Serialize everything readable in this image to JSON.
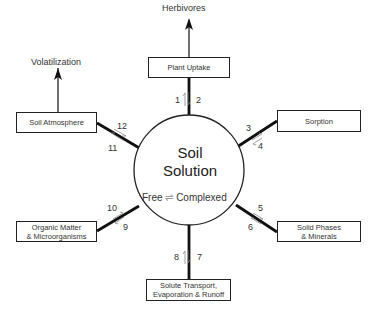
{
  "diagram": {
    "center": {
      "title_line1": "Soil",
      "title_line2": "Solution",
      "equilibrium_left": "Free",
      "equilibrium_arrow": "⇌",
      "equilibrium_right": "Complexed"
    },
    "nodes": [
      {
        "id": "plant_uptake",
        "label": "Plant Uptake",
        "numbers": [
          "1",
          "2"
        ]
      },
      {
        "id": "sorption",
        "label": "Sorption",
        "numbers": [
          "3",
          "4"
        ]
      },
      {
        "id": "solid_phases",
        "label_line1": "Solid Phases",
        "label_line2": "& Minerals",
        "numbers": [
          "5",
          "6"
        ]
      },
      {
        "id": "solute_transport",
        "label_line1": "Solute Transport,",
        "label_line2": "Evaporation & Runoff",
        "numbers": [
          "7",
          "8"
        ]
      },
      {
        "id": "organic_matter",
        "label_line1": "Organic Matter",
        "label_line2": "& Microorganisms",
        "numbers": [
          "9",
          "10"
        ]
      },
      {
        "id": "soil_atmosphere",
        "label": "Soil Atmosphere",
        "numbers": [
          "11",
          "12"
        ]
      }
    ],
    "outputs": {
      "herbivores": "Herbivores",
      "volatilization": "Volatilization"
    }
  }
}
